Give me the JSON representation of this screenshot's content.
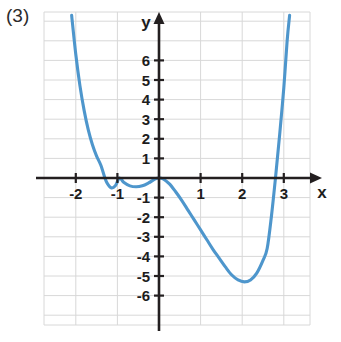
{
  "figure": {
    "label": "(3)",
    "background_color": "#ffffff",
    "grid_color": "#d8d8d8",
    "axis_color": "#231f20",
    "curve_color": "#4e96cc"
  },
  "chart_data": {
    "type": "line",
    "title": "",
    "xlabel": "x",
    "ylabel": "y",
    "xlim": [
      -2.75,
      3.65
    ],
    "ylim": [
      -7.3,
      8.3
    ],
    "grid": true,
    "legend": null,
    "x_ticks": [
      -2,
      -1,
      1,
      2,
      3
    ],
    "x_tick_labels": [
      "-2",
      "-1",
      "1",
      "2",
      "3"
    ],
    "y_ticks": [
      6,
      5,
      4,
      3,
      2,
      1,
      -1,
      -2,
      -3,
      -4,
      -5,
      -6
    ],
    "y_tick_labels": [
      "6",
      "5",
      "4",
      "3",
      "2",
      "1",
      "-1",
      "-2",
      "-3",
      "-4",
      "-5",
      "-6"
    ],
    "roots": [
      -1.3,
      -0.95,
      0,
      2.8
    ],
    "local_minima": [
      {
        "x": -1.15,
        "y": -0.5
      },
      {
        "x": 2.05,
        "y": -5.3
      }
    ],
    "local_maxima": [
      {
        "x": 0,
        "y": 0
      }
    ],
    "series": [
      {
        "name": "f(x)",
        "values": [
          {
            "x": -2.1,
            "y": 8.3
          },
          {
            "x": -2.0,
            "y": 6.3
          },
          {
            "x": -1.9,
            "y": 4.7
          },
          {
            "x": -1.8,
            "y": 3.45
          },
          {
            "x": -1.7,
            "y": 2.45
          },
          {
            "x": -1.6,
            "y": 1.7
          },
          {
            "x": -1.5,
            "y": 1.12
          },
          {
            "x": -1.4,
            "y": 0.66
          },
          {
            "x": -1.3,
            "y": 0.0
          },
          {
            "x": -1.25,
            "y": -0.25
          },
          {
            "x": -1.15,
            "y": -0.5
          },
          {
            "x": -1.05,
            "y": -0.4
          },
          {
            "x": -0.95,
            "y": 0.0
          },
          {
            "x": -0.85,
            "y": -0.22
          },
          {
            "x": -0.7,
            "y": -0.4
          },
          {
            "x": -0.55,
            "y": -0.45
          },
          {
            "x": -0.4,
            "y": -0.4
          },
          {
            "x": -0.25,
            "y": -0.25
          },
          {
            "x": -0.1,
            "y": -0.06
          },
          {
            "x": 0.0,
            "y": 0.0
          },
          {
            "x": 0.1,
            "y": -0.05
          },
          {
            "x": 0.25,
            "y": -0.3
          },
          {
            "x": 0.4,
            "y": -0.7
          },
          {
            "x": 0.55,
            "y": -1.15
          },
          {
            "x": 0.7,
            "y": -1.65
          },
          {
            "x": 0.85,
            "y": -2.15
          },
          {
            "x": 1.0,
            "y": -2.65
          },
          {
            "x": 1.15,
            "y": -3.15
          },
          {
            "x": 1.3,
            "y": -3.65
          },
          {
            "x": 1.45,
            "y": -4.1
          },
          {
            "x": 1.6,
            "y": -4.55
          },
          {
            "x": 1.75,
            "y": -4.95
          },
          {
            "x": 1.9,
            "y": -5.2
          },
          {
            "x": 2.05,
            "y": -5.3
          },
          {
            "x": 2.2,
            "y": -5.2
          },
          {
            "x": 2.35,
            "y": -4.85
          },
          {
            "x": 2.5,
            "y": -4.2
          },
          {
            "x": 2.6,
            "y": -3.6
          },
          {
            "x": 2.7,
            "y": -2.0
          },
          {
            "x": 2.8,
            "y": 0.0
          },
          {
            "x": 2.9,
            "y": 2.2
          },
          {
            "x": 3.0,
            "y": 4.6
          },
          {
            "x": 3.08,
            "y": 7.0
          },
          {
            "x": 3.14,
            "y": 8.3
          }
        ]
      }
    ]
  }
}
